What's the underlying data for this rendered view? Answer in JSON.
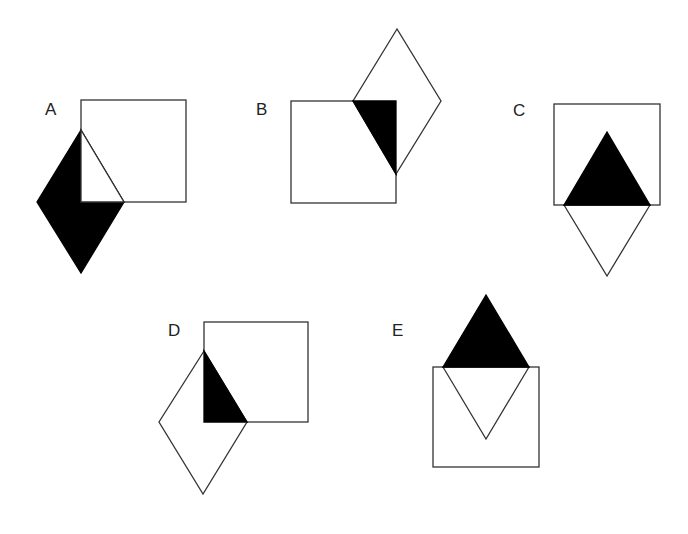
{
  "diagram": {
    "type": "figure-options",
    "stroke_color": "#333333",
    "fill_color": "#000000",
    "options": [
      {
        "label": "A",
        "label_pos": [
          45,
          101
        ]
      },
      {
        "label": "B",
        "label_pos": [
          256,
          101
        ]
      },
      {
        "label": "C",
        "label_pos": [
          513,
          102
        ]
      },
      {
        "label": "D",
        "label_pos": [
          168,
          322
        ]
      },
      {
        "label": "E",
        "label_pos": [
          392,
          322
        ]
      }
    ]
  }
}
